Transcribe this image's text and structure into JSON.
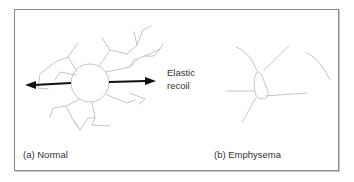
{
  "figure": {
    "panels": [
      {
        "id": "a",
        "caption": "(a)  Normal"
      },
      {
        "id": "b",
        "caption": "(b)   Emphysema"
      }
    ],
    "annotation": {
      "line1": "Elastic",
      "line2": "recoil"
    },
    "colors": {
      "border": "#8a8a8a",
      "tissue_lines": "#c4c4c4",
      "arrows": "#111111",
      "text": "#333333"
    }
  }
}
